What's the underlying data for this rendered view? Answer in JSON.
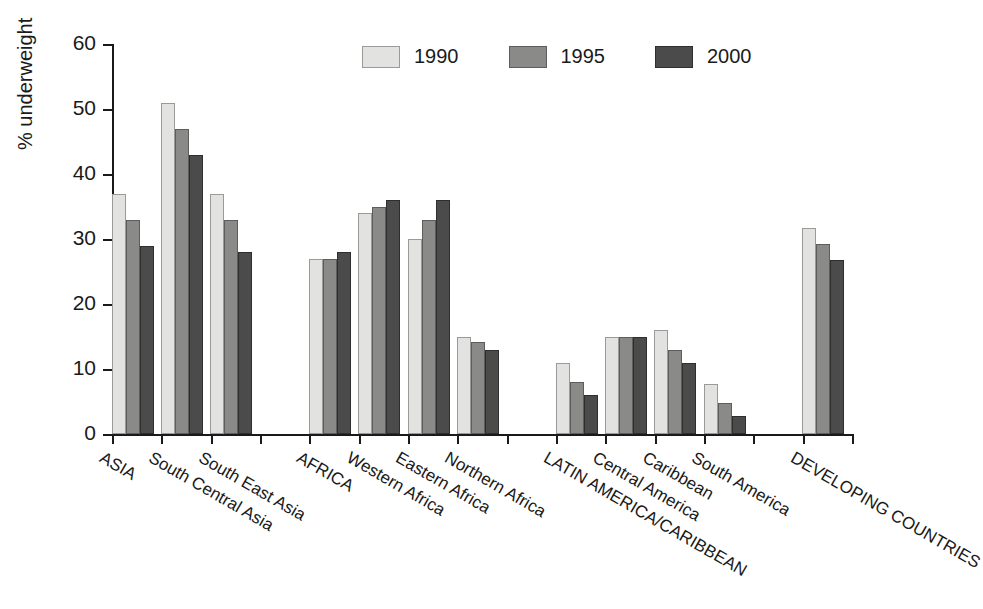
{
  "chart_data": {
    "type": "bar",
    "title": "",
    "xlabel": "",
    "ylabel": "% underweight",
    "ylim": [
      0,
      60
    ],
    "yticks": [
      0,
      10,
      20,
      30,
      40,
      50,
      60
    ],
    "grid": false,
    "legend_position": "top-center",
    "categories": [
      "ASIA",
      "South Central Asia",
      "South East Asia",
      "",
      "AFRICA",
      "Western Africa",
      "Eastern Africa",
      "Northern Africa",
      "",
      "LATIN AMERICA/CARIBBEAN",
      "Central America",
      "Caribbean",
      "South America",
      "",
      "DEVELOPING COUNTRIES"
    ],
    "series": [
      {
        "name": "1990",
        "color": "#e2e2e0",
        "values": [
          37,
          51,
          37,
          null,
          27,
          34,
          30,
          15,
          null,
          11,
          15,
          16,
          7.7,
          null,
          31.7
        ]
      },
      {
        "name": "1995",
        "color": "#8a8a88",
        "values": [
          33,
          47,
          33,
          null,
          27,
          35,
          33,
          14.2,
          null,
          8,
          15,
          13,
          4.7,
          null,
          29.2
        ]
      },
      {
        "name": "2000",
        "color": "#4b4b4b",
        "values": [
          29,
          43,
          28,
          null,
          28,
          36,
          36,
          13,
          null,
          6,
          15,
          11,
          2.7,
          null,
          26.7
        ]
      }
    ],
    "legend": [
      {
        "label": "1990",
        "swatch": "s0"
      },
      {
        "label": "1995",
        "swatch": "s1"
      },
      {
        "label": "2000",
        "swatch": "s2"
      }
    ]
  }
}
